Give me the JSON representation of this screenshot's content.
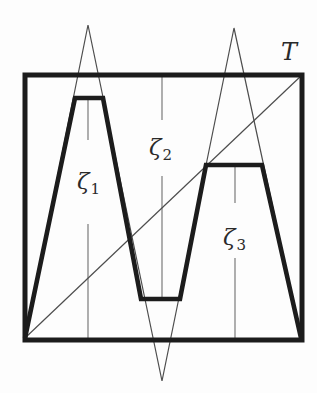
{
  "figure": {
    "labels": {
      "T": {
        "text": "T"
      },
      "zeta1": {
        "base": "ζ",
        "sub": "1"
      },
      "zeta2": {
        "base": "ζ",
        "sub": "2"
      },
      "zeta3": {
        "base": "ζ",
        "sub": "3"
      }
    },
    "label_positions": {
      "T": {
        "x": 289,
        "y": 52
      },
      "zeta1": {
        "x": 88,
        "y": 181
      },
      "zeta2": {
        "x": 160,
        "y": 147
      },
      "zeta3": {
        "x": 234,
        "y": 237
      }
    },
    "colors": {
      "background": "#fdfdfd",
      "thick_stroke": "#1c1c1c",
      "thin_stroke": "#4d4d4d",
      "guide_stroke": "#6e6e6e"
    },
    "geometry": {
      "box": {
        "x": 25,
        "y": 75,
        "width": 277,
        "height": 265
      },
      "thick_curve": [
        [
          25,
          338
        ],
        [
          75,
          98
        ],
        [
          103,
          98
        ],
        [
          141,
          299
        ],
        [
          180,
          299
        ],
        [
          206,
          165
        ],
        [
          262,
          165
        ],
        [
          301,
          338
        ]
      ],
      "thin_zigzag": [
        [
          25,
          338
        ],
        [
          88,
          25
        ],
        [
          162,
          381
        ],
        [
          234,
          28
        ],
        [
          301,
          338
        ]
      ],
      "diagonal": [
        [
          25,
          338
        ],
        [
          302,
          75
        ]
      ],
      "guide_lines": [
        {
          "x": 88,
          "segments": [
            [
              98,
              140
            ],
            [
              224,
              340
            ]
          ]
        },
        {
          "x": 162,
          "segments": [
            [
              76,
              120
            ],
            [
              176,
              297
            ]
          ]
        },
        {
          "x": 235,
          "segments": [
            [
              165,
              203
            ],
            [
              258,
              340
            ]
          ]
        }
      ]
    }
  }
}
